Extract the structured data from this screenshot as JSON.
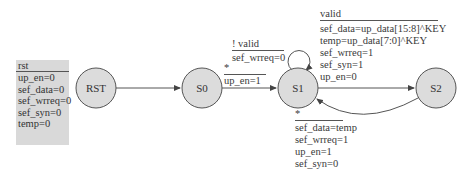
{
  "reset_box": {
    "title": "rst",
    "assignments": [
      "up_en=0",
      "sef_data=0",
      "sef_wrreq=0",
      "sef_syn=0",
      "temp=0"
    ]
  },
  "states": [
    {
      "id": "RST",
      "label": "RST"
    },
    {
      "id": "S0",
      "label": "S0"
    },
    {
      "id": "S1",
      "label": "S1"
    },
    {
      "id": "S2",
      "label": "S2"
    }
  ],
  "transitions": {
    "rst_s0": {
      "from": "RST",
      "to": "S0"
    },
    "s0_s1": {
      "from": "S0",
      "to": "S1",
      "condition": "*",
      "actions": [
        "up_en=1"
      ]
    },
    "s1_self": {
      "from": "S1",
      "to": "S1",
      "condition": "! valid",
      "actions": [
        "sef_wrreq=0"
      ]
    },
    "s1_s2": {
      "from": "S1",
      "to": "S2",
      "condition": "valid",
      "actions": [
        "sef_data=up_data[15:8]^KEY",
        "temp=up_data[7:0]^KEY",
        "sef_wrreq=1",
        "sef_syn=1",
        "up_en=0"
      ]
    },
    "s2_s1": {
      "from": "S2",
      "to": "S1",
      "condition": "*",
      "actions": [
        "sef_data=temp",
        "sef_wrreq=1",
        "up_en=1",
        "sef_syn=0"
      ]
    }
  },
  "colors": {
    "state_fill": "#dcdcdc",
    "stroke": "#555555",
    "box_fill": "#d9d9d9"
  }
}
